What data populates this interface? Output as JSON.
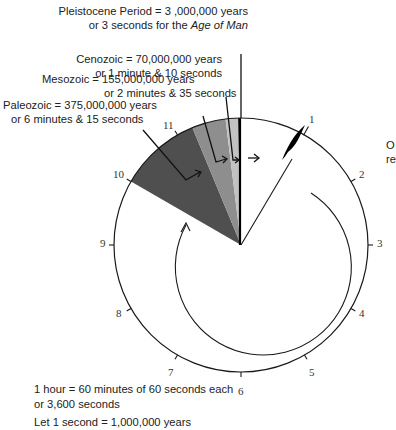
{
  "diagram": {
    "annotations": {
      "pleistocene": {
        "line1": "Pleistocene Period = 3 ,000,000 years",
        "line2_prefix": "or 3 seconds for the ",
        "line2_italic": "Age of Man"
      },
      "cenozoic": {
        "line1": "Cenozoic = 70,000,000 years",
        "line2": "or 1 minute & 10 seconds"
      },
      "mesozoic": {
        "line1": "Mesozoic = 155,000,000 years",
        "line2": "or 2 minutes & 35 seconds"
      },
      "paleozoic": {
        "line1": "Paleozoic = 375,000,000 years",
        "line2": "or 6 minutes & 15 seconds"
      }
    },
    "clock_numbers": [
      "1",
      "2",
      "3",
      "4",
      "5",
      "6",
      "7",
      "8",
      "9",
      "10",
      "11"
    ],
    "footnote": {
      "line1": "1 hour = 60 minutes of 60 seconds each",
      "line2": "or 3,600 seconds",
      "line3": "Let 1 second = 1,000,000 years"
    },
    "clipped_right_text": {
      "line1": "O",
      "line2": "re"
    },
    "eras": [
      {
        "name": "Paleozoic",
        "years": 375000000,
        "seconds": 375,
        "color": "#4d4d4d"
      },
      {
        "name": "Mesozoic",
        "years": 155000000,
        "seconds": 155,
        "color": "#8c8c8c"
      },
      {
        "name": "Cenozoic",
        "years": 70000000,
        "seconds": 70,
        "color": "#bdbdbd"
      },
      {
        "name": "Pleistocene",
        "years": 3000000,
        "seconds": 3,
        "color": "#000000"
      }
    ],
    "colors": {
      "outline": "#1a1a1a",
      "background": "#ffffff"
    }
  }
}
